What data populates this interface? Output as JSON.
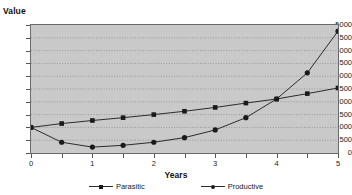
{
  "chart_data": {
    "type": "line",
    "title": "",
    "xlabel": "Years",
    "ylabel": "Value",
    "x": [
      0,
      0.5,
      1,
      1.5,
      2,
      2.5,
      3,
      3.5,
      4,
      4.5,
      5
    ],
    "xlim": [
      0,
      5
    ],
    "ylim": [
      0,
      5000
    ],
    "xticks": [
      0,
      0.5,
      1,
      1.5,
      2,
      2.5,
      3,
      3.5,
      4,
      4.5,
      5
    ],
    "xtick_labels": [
      "0",
      "",
      "1",
      "",
      "2",
      "",
      "3",
      "",
      "4",
      "",
      "5"
    ],
    "yticks": [
      0,
      500,
      1000,
      1500,
      2000,
      2500,
      3000,
      3500,
      4000,
      4500,
      5000
    ],
    "ytick_labels": [
      "0",
      "500",
      "1000",
      "1500",
      "2000",
      "2500",
      "3000",
      "3500",
      "4000",
      "4500",
      "5000"
    ],
    "grid": "horizontal-dotted",
    "legend_position": "bottom-center",
    "plot_background": "#c9c9c9",
    "line_color": "#2b2b2b",
    "marker_color": "#1a1a1a",
    "series": [
      {
        "name": "Parasitic",
        "marker": "square",
        "values": [
          1000,
          1150,
          1270,
          1380,
          1500,
          1630,
          1780,
          1950,
          2110,
          2320,
          2540
        ]
      },
      {
        "name": "Productive",
        "marker": "circle",
        "values": [
          1000,
          420,
          230,
          300,
          420,
          600,
          900,
          1380,
          2110,
          3130,
          4760
        ]
      }
    ]
  },
  "legend": {
    "items": [
      {
        "label": "Parasitic",
        "marker": "square"
      },
      {
        "label": "Productive",
        "marker": "circle"
      }
    ]
  }
}
